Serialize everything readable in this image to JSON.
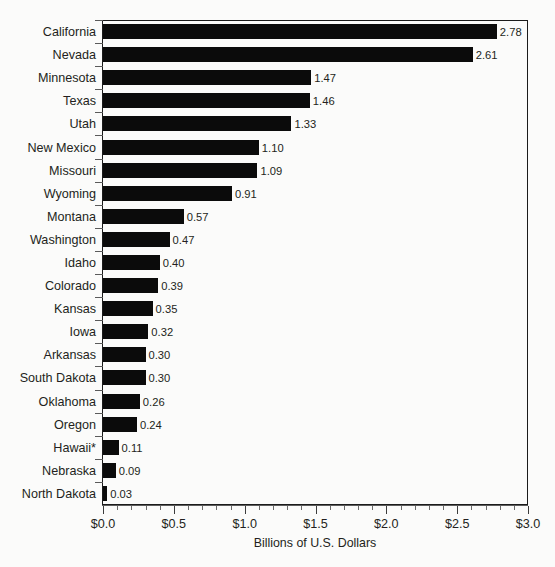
{
  "chart_data": {
    "type": "bar",
    "orientation": "horizontal",
    "title": "",
    "xlabel": "Billions of U.S. Dollars",
    "ylabel": "",
    "xlim": [
      0.0,
      3.0
    ],
    "xtick_labels": [
      "$0.0",
      "$0.5",
      "$1.0",
      "$1.5",
      "$2.0",
      "$2.5",
      "$3.0"
    ],
    "xtick_values": [
      0.0,
      0.5,
      1.0,
      1.5,
      2.0,
      2.5,
      3.0
    ],
    "minor_tick_step": 0.1,
    "grid": false,
    "legend": null,
    "bar_color": "#0b0b0b",
    "categories": [
      "California",
      "Nevada",
      "Minnesota",
      "Texas",
      "Utah",
      "New Mexico",
      "Missouri",
      "Wyoming",
      "Montana",
      "Washington",
      "Idaho",
      "Colorado",
      "Kansas",
      "Iowa",
      "Arkansas",
      "South Dakota",
      "Oklahoma",
      "Oregon",
      "Hawaii*",
      "Nebraska",
      "North Dakota"
    ],
    "values": [
      2.78,
      2.61,
      1.47,
      1.46,
      1.33,
      1.1,
      1.09,
      0.91,
      0.57,
      0.47,
      0.4,
      0.39,
      0.35,
      0.32,
      0.3,
      0.3,
      0.26,
      0.24,
      0.11,
      0.09,
      0.03
    ],
    "value_labels": [
      "2.78",
      "2.61",
      "1.47",
      "1.46",
      "1.33",
      "1.10",
      "1.09",
      "0.91",
      "0.57",
      "0.47",
      "0.40",
      "0.39",
      "0.35",
      "0.32",
      "0.30",
      "0.30",
      "0.26",
      "0.24",
      "0.11",
      "0.09",
      "0.03"
    ]
  }
}
